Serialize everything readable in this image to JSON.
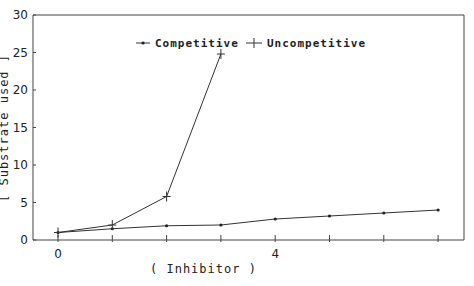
{
  "chart_data": {
    "type": "line",
    "title": "",
    "xlabel": "( Inhibitor )",
    "ylabel": "[ Substrate used ]",
    "xlim": [
      -0.5,
      7.5
    ],
    "ylim": [
      0,
      30
    ],
    "x_ticks": [
      0,
      1,
      2,
      3,
      4,
      5,
      6,
      7
    ],
    "x_tick_labels": [
      "0",
      "",
      "",
      "",
      "4",
      "",
      "",
      ""
    ],
    "y_ticks": [
      0,
      5,
      10,
      15,
      20,
      25,
      30
    ],
    "y_tick_labels": [
      "0",
      "5",
      "10",
      "15",
      "20",
      "25",
      "30"
    ],
    "grid": false,
    "legend_position": "top-center",
    "series": [
      {
        "name": "Competitive",
        "marker": "dot",
        "x": [
          0,
          1,
          2,
          3,
          4,
          5,
          6,
          7
        ],
        "values": [
          1.0,
          1.5,
          1.9,
          2.0,
          2.8,
          3.2,
          3.6,
          4.0
        ]
      },
      {
        "name": "Uncompetitive",
        "marker": "plus",
        "x": [
          0,
          1,
          2,
          3
        ],
        "values": [
          1.0,
          2.0,
          5.8,
          24.8
        ]
      }
    ]
  },
  "legend": {
    "competitive_label": "Competitive",
    "uncompetitive_label": "Uncompetitive"
  },
  "axes": {
    "x_label": "( Inhibitor )",
    "y_label": "[ Substrate used ]"
  },
  "colors": {
    "line": "#333333",
    "axis": "#444444",
    "background": "#ffffff"
  }
}
